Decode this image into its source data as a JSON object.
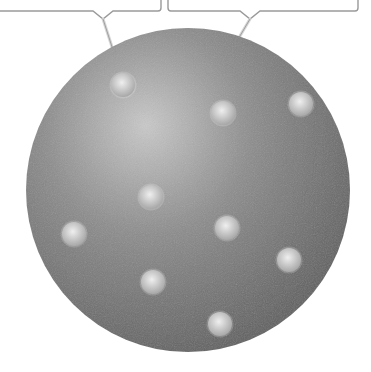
{
  "diagram": {
    "type": "plum-pudding-atom-model",
    "colors": {
      "sphere_light": "#c9c9c9",
      "sphere_mid": "#8c8c8c",
      "sphere_dark": "#5e5e5e",
      "electron_light": "#efefef",
      "electron_dark": "#a8a8a8",
      "callout_stroke": "#9a9a9a",
      "background": "#ffffff"
    },
    "sphere": {
      "cx": 188,
      "cy": 190,
      "r": 162
    },
    "electrons": [
      {
        "cx": 123,
        "cy": 85
      },
      {
        "cx": 223,
        "cy": 113
      },
      {
        "cx": 301,
        "cy": 104
      },
      {
        "cx": 151,
        "cy": 197
      },
      {
        "cx": 74,
        "cy": 234
      },
      {
        "cx": 227,
        "cy": 228
      },
      {
        "cx": 289,
        "cy": 260
      },
      {
        "cx": 153,
        "cy": 282
      },
      {
        "cx": 220,
        "cy": 324
      }
    ],
    "callouts": [
      {
        "label": "",
        "box": {
          "x1": -4,
          "x2": 161,
          "y": 11
        },
        "notch_x": 103,
        "pointer": {
          "x": 124,
          "y": 84
        }
      },
      {
        "label": "",
        "box": {
          "x1": 168,
          "x2": 358,
          "y": 11
        },
        "notch_x": 250,
        "pointer": {
          "x": 224,
          "y": 63
        }
      }
    ]
  }
}
